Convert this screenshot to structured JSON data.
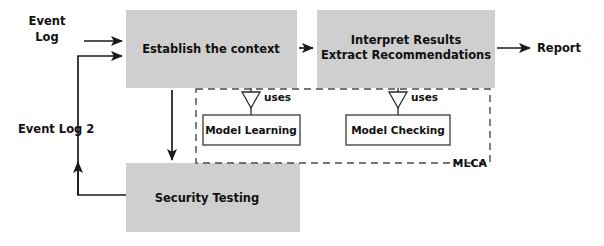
{
  "diagram": {
    "colors": {
      "process_fill": "#cfcfcf",
      "inner_fill": "#fdfdfd",
      "stroke": "#1a1a1a",
      "dashed_stroke": "#4a4a4a",
      "text": "#111111",
      "background": "#ffffff"
    },
    "inputs": [
      {
        "id": "event-log",
        "label_line1": "Event",
        "label_line2": "Log"
      }
    ],
    "outputs": [
      {
        "id": "report",
        "label": "Report"
      }
    ],
    "feedback": [
      {
        "id": "event-log-2",
        "label": "Event Log 2"
      }
    ],
    "processes": [
      {
        "id": "establish-context",
        "label": "Establish the context"
      },
      {
        "id": "interpret-results",
        "label_line1": "Interpret Results",
        "label_line2": "Extract Recommendations"
      },
      {
        "id": "security-testing",
        "label": "Security Testing"
      }
    ],
    "components": [
      {
        "id": "model-learning",
        "label": "Model Learning",
        "relation": "uses"
      },
      {
        "id": "model-checking",
        "label": "Model Checking",
        "relation": "uses"
      }
    ],
    "relations": {
      "uses_left": "uses",
      "uses_right": "uses"
    },
    "region": {
      "id": "mlca-region",
      "label": "MLCA"
    }
  }
}
